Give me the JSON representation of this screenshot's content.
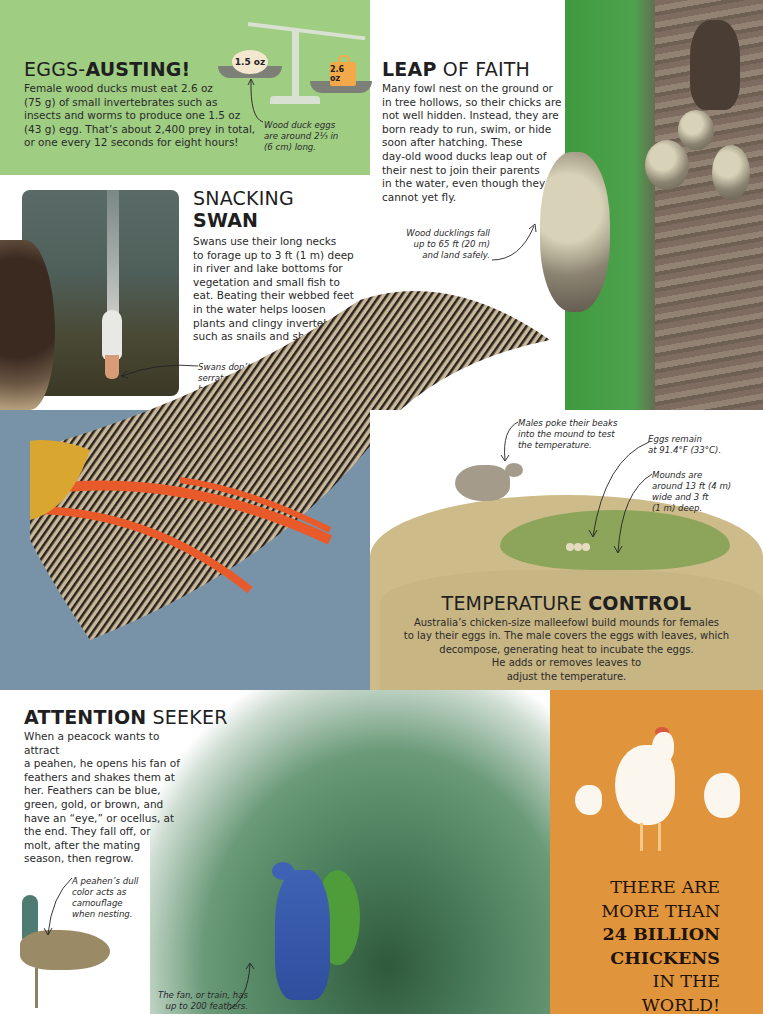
{
  "eggs_austing": {
    "title_light": "EGGS-",
    "title_bold": "AUSTING!",
    "body_lines": [
      "Female wood ducks must eat 2.6 oz",
      "(75 g) of small invertebrates such as",
      "insects and worms to produce one 1.5 oz",
      "(43 g) egg. That’s about 2,400 prey in total,",
      "or one every 12 seconds for eight hours!"
    ],
    "egg_label": "1.5 oz",
    "weight_label": "2.6 oz",
    "caption_lines": [
      "Wood duck eggs",
      "are around 2⅓ in",
      "(6 cm) long."
    ],
    "colors": {
      "panel": "#9fcd82",
      "weight": "#f3a94a"
    }
  },
  "leap_of_faith": {
    "title_bold": "LEAP",
    "title_light": " OF FAITH",
    "body_lines": [
      "Many fowl nest on the ground or",
      "in tree hollows, so their chicks are",
      "not well hidden. Instead, they are",
      "born ready to run, swim, or hide",
      "soon after hatching. These",
      "day-old wood ducks leap out of",
      "their nest to join their parents",
      "in the water, even though they",
      "cannot yet fly."
    ],
    "caption_lines": [
      "Wood ducklings fall",
      "up to 65 ft (20 m)",
      "and land safely."
    ]
  },
  "snacking_swan": {
    "title_light": "SNACKING",
    "title_bold": "SWAN",
    "body_lines": [
      "Swans use their long necks",
      "to forage up to 3 ft (1 m) deep",
      "in river and lake bottoms for",
      "vegetation and small fish to",
      "eat. Beating their webbed feet",
      "in the water helps loosen",
      "plants and clingy invertebrates",
      "such as snails and shellfish."
    ],
    "caption_lines": [
      "Swans don’t have teeth—",
      "serrated edges on their beaks",
      "help them grip their food."
    ]
  },
  "temperature_control": {
    "title_light": "TEMPERATURE ",
    "title_bold": "CONTROL",
    "body_lines": [
      "Australia’s chicken-size malleefowl build mounds for females",
      "to lay their eggs in. The male covers the eggs with leaves, which",
      "decompose, generating heat to incubate the eggs.",
      "He adds or removes leaves to",
      "adjust the temperature."
    ],
    "caption_males": [
      "Males poke their beaks",
      "into the mound to test",
      "the temperature."
    ],
    "caption_eggs": [
      "Eggs remain",
      "at 91.4°F (33°C)."
    ],
    "caption_mounds": [
      "Mounds are",
      "around 13 ft (4 m)",
      "wide and 3 ft",
      "(1 m) deep."
    ],
    "colors": {
      "mound": "#cdbb8a",
      "mound_core": "#8da55a"
    }
  },
  "attention_seeker": {
    "title_bold": "ATTENTION",
    "title_light": " SEEKER",
    "body_lines": [
      "When a peacock wants to attract",
      "a peahen, he opens his fan of",
      "feathers and shakes them at",
      "her. Feathers can be blue,",
      "green, gold, or brown, and",
      "have an “eye,” or ocellus, at",
      "the end. They fall off, or",
      "molt, after the mating",
      "season, then regrow."
    ],
    "caption_peahen": [
      "A peahen’s dull",
      "color acts as",
      "camouflage",
      "when nesting."
    ],
    "caption_fan": [
      "The fan, or train, has",
      "up to 200 feathers."
    ]
  },
  "chickens": {
    "lines": [
      "THERE ARE",
      "MORE THAN"
    ],
    "bold_lines": [
      "24 BILLION",
      "CHICKENS"
    ],
    "end_lines": [
      "IN THE",
      "WORLD!"
    ],
    "colors": {
      "panel": "#e0953d"
    }
  }
}
